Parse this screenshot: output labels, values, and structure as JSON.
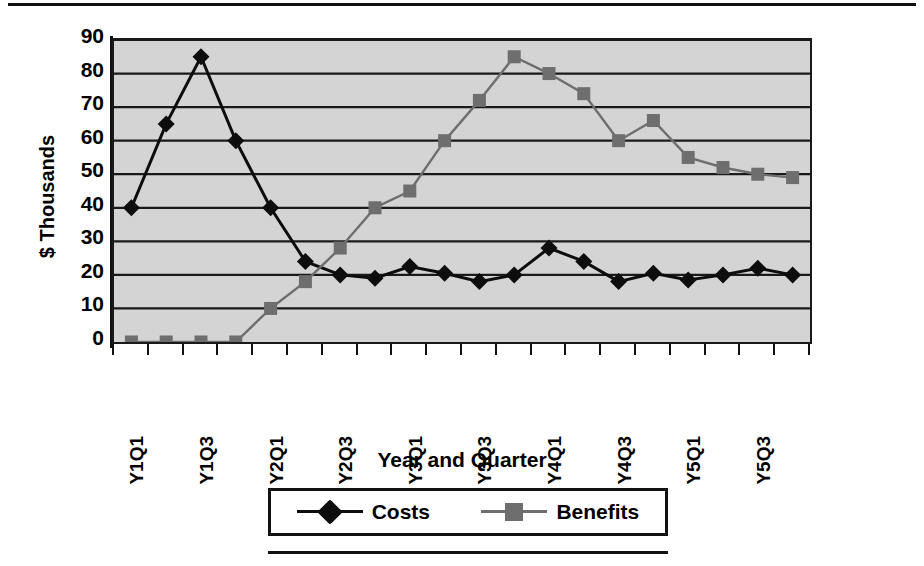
{
  "chart_data": {
    "type": "line",
    "title": "",
    "xlabel": "Year and Quarter",
    "ylabel": "$ Thousands",
    "ylim": [
      0,
      90
    ],
    "ytick_values": [
      0,
      10,
      20,
      30,
      40,
      50,
      60,
      70,
      80,
      90
    ],
    "grid": true,
    "legend_position": "bottom",
    "plot_background": "#d4d4d4",
    "x": [
      "Y1Q1",
      "Y1Q2",
      "Y1Q3",
      "Y1Q4",
      "Y2Q1",
      "Y2Q2",
      "Y2Q3",
      "Y2Q4",
      "Y3Q1",
      "Y3Q2",
      "Y3Q3",
      "Y3Q4",
      "Y4Q1",
      "Y4Q2",
      "Y4Q3",
      "Y4Q4",
      "Y5Q1",
      "Y5Q2",
      "Y5Q3",
      "Y5Q4"
    ],
    "xtick_labels": [
      "Y1Q1",
      "",
      "Y1Q3",
      "",
      "Y2Q1",
      "",
      "Y2Q3",
      "",
      "Y3Q1",
      "",
      "Y3Q3",
      "",
      "Y4Q1",
      "",
      "Y4Q3",
      "",
      "Y5Q1",
      "",
      "Y5Q3",
      ""
    ],
    "series": [
      {
        "name": "Costs",
        "color": "#0d0d0d",
        "marker": "diamond",
        "values": [
          40,
          65,
          85,
          60,
          40,
          24,
          20,
          19,
          22.5,
          20.5,
          18,
          20,
          28,
          24,
          18,
          20.5,
          18.5,
          20,
          22,
          20
        ]
      },
      {
        "name": "Benefits",
        "color": "#6e6e6e",
        "marker": "square",
        "values": [
          0,
          0,
          0,
          0,
          10,
          18,
          28,
          40,
          45,
          60,
          72,
          85,
          80,
          74,
          60,
          66,
          55,
          52,
          50,
          49
        ]
      }
    ]
  },
  "legend": {
    "entries": [
      {
        "label": "Costs"
      },
      {
        "label": "Benefits"
      }
    ]
  },
  "axis": {
    "y_title": "$ Thousands",
    "x_title": "Year and Quarter"
  }
}
